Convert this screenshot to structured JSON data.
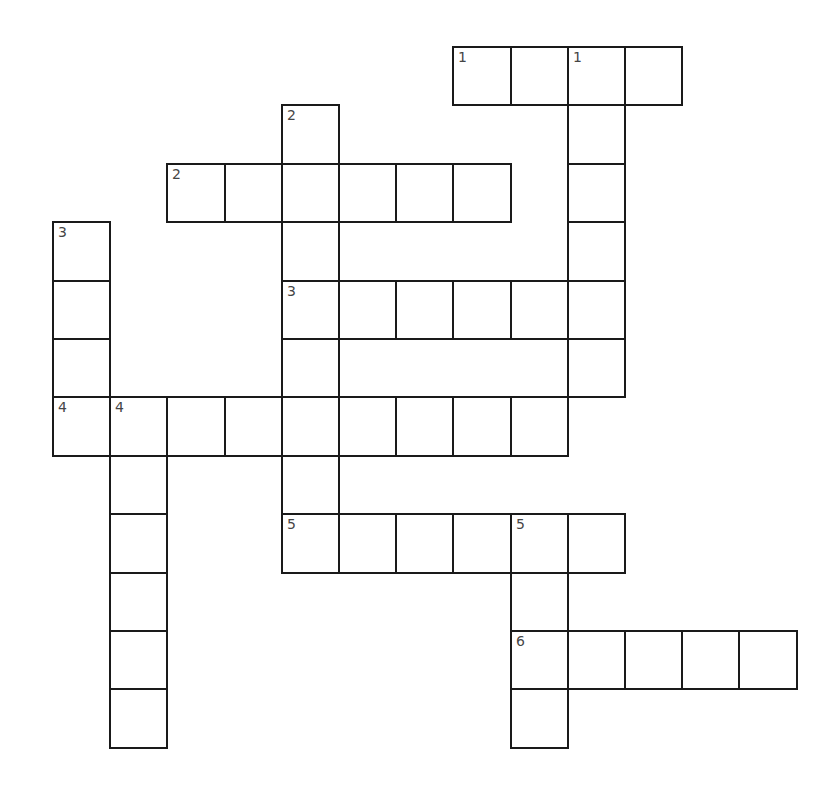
{
  "puzzle": {
    "title": "Crossword",
    "entries": [
      {
        "number": "1",
        "direction": "across",
        "row": 0,
        "col": 7,
        "length": 4
      },
      {
        "number": "1",
        "direction": "down",
        "row": 0,
        "col": 9,
        "length": 6
      },
      {
        "number": "2",
        "direction": "down",
        "row": 1,
        "col": 4,
        "length": 7
      },
      {
        "number": "2",
        "direction": "across",
        "row": 2,
        "col": 2,
        "length": 6
      },
      {
        "number": "3",
        "direction": "down",
        "row": 3,
        "col": 0,
        "length": 4
      },
      {
        "number": "3",
        "direction": "across",
        "row": 4,
        "col": 4,
        "length": 6
      },
      {
        "number": "4",
        "direction": "across",
        "row": 6,
        "col": 0,
        "length": 9
      },
      {
        "number": "4",
        "direction": "down",
        "row": 6,
        "col": 1,
        "length": 6
      },
      {
        "number": "5",
        "direction": "across",
        "row": 8,
        "col": 4,
        "length": 6
      },
      {
        "number": "5",
        "direction": "down",
        "row": 8,
        "col": 8,
        "length": 4
      },
      {
        "number": "6",
        "direction": "across",
        "row": 10,
        "col": 8,
        "length": 5
      }
    ]
  }
}
